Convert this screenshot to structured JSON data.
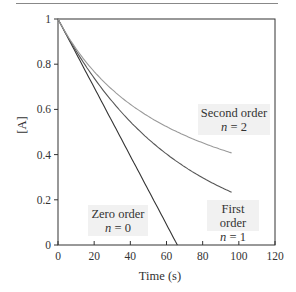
{
  "chart_data": {
    "type": "line",
    "title": "",
    "xlabel": "Time (s)",
    "ylabel": "[A]",
    "xlim": [
      0,
      120
    ],
    "ylim": [
      0,
      1
    ],
    "xticks": [
      0,
      20,
      40,
      60,
      80,
      100,
      120
    ],
    "yticks": [
      0,
      0.2,
      0.4,
      0.6,
      0.8,
      1
    ],
    "xtick_labels": [
      "0",
      "20",
      "40",
      "60",
      "80",
      "100",
      "120"
    ],
    "ytick_labels": [
      "0",
      "0.2",
      "0.4",
      "0.6",
      "0.8",
      "1"
    ],
    "grid": false,
    "legend": "inline annotations",
    "series": [
      {
        "name": "Zero order",
        "order_label": "n = 0",
        "color": "#333333",
        "x": [
          0,
          10,
          20,
          30,
          40,
          50,
          60,
          66
        ],
        "y": [
          1,
          0.849,
          0.698,
          0.547,
          0.396,
          0.245,
          0.094,
          0.0
        ]
      },
      {
        "name": "First order",
        "order_label": "n = 1",
        "color": "#555555",
        "x": [
          0,
          10,
          20,
          30,
          40,
          50,
          60,
          70,
          80,
          90,
          96
        ],
        "y": [
          1,
          0.86,
          0.739,
          0.636,
          0.547,
          0.47,
          0.404,
          0.348,
          0.299,
          0.257,
          0.234
        ]
      },
      {
        "name": "Second order",
        "order_label": "n = 2",
        "color": "#9a9a9a",
        "x": [
          0,
          10,
          20,
          30,
          40,
          50,
          60,
          70,
          80,
          90,
          96
        ],
        "y": [
          1,
          0.869,
          0.768,
          0.688,
          0.623,
          0.57,
          0.525,
          0.486,
          0.453,
          0.424,
          0.408
        ]
      }
    ],
    "annotations": [
      {
        "text": "Zero order",
        "sub": "n = 0"
      },
      {
        "text": "First order",
        "sub": "n = 1"
      },
      {
        "text": "Second order",
        "sub": "n = 2"
      }
    ]
  },
  "labels": {
    "xlabel": "Time (s)",
    "ylabel": "[A]",
    "zero_title": "Zero order",
    "zero_n_var": "n",
    "zero_n_val": " = 0",
    "first_title": "First order",
    "first_n_var": "n",
    "first_n_val": " = 1",
    "second_title": "Second order",
    "second_n_var": "n",
    "second_n_val": " = 2"
  }
}
